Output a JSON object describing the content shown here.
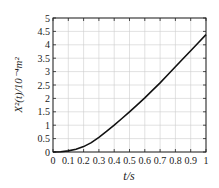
{
  "chart_data": {
    "type": "line",
    "title": "",
    "xlabel": "t/s",
    "ylabel": "X²(t)/10⁻⁴m²",
    "xlim": [
      0,
      1
    ],
    "ylim": [
      0,
      5
    ],
    "grid": true,
    "legend": null,
    "x_ticks": [
      "0",
      "0.1",
      "0.2",
      "0.3",
      "0.4",
      "0.5",
      "0.6",
      "0.7",
      "0.8",
      "0.9",
      "1"
    ],
    "y_ticks": [
      "0",
      "0.5",
      "1",
      "1.5",
      "2",
      "2.5",
      "3",
      "3.5",
      "4",
      "4.5",
      "5"
    ],
    "series": [
      {
        "name": "mean square displacement",
        "x": [
          0,
          0.05,
          0.1,
          0.15,
          0.2,
          0.25,
          0.3,
          0.35,
          0.4,
          0.45,
          0.5,
          0.55,
          0.6,
          0.65,
          0.7,
          0.75,
          0.8,
          0.85,
          0.9,
          0.95,
          1.0
        ],
        "values": [
          0,
          0.01,
          0.04,
          0.1,
          0.2,
          0.35,
          0.55,
          0.77,
          1.0,
          1.25,
          1.5,
          1.76,
          2.02,
          2.3,
          2.58,
          2.88,
          3.18,
          3.48,
          3.78,
          4.08,
          4.38
        ]
      }
    ]
  }
}
